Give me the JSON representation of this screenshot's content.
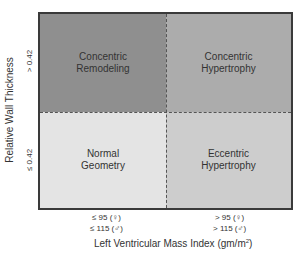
{
  "diagram": {
    "type": "2x2 classification grid",
    "y_axis": {
      "title": "Relative Wall Thickness",
      "ticks": [
        "> 0.42",
        "≤ 0.42"
      ]
    },
    "x_axis": {
      "title": "Left Ventricular Mass Index (gm/m",
      "title_sup": "2",
      "title_close": ")",
      "ticks": [
        {
          "line1": "≤ 95 (♀)",
          "line2": "≤ 115 (♂)"
        },
        {
          "line1": "> 95 (♀)",
          "line2": "> 115 (♂)"
        }
      ]
    },
    "quadrants": {
      "top_left": {
        "line1": "Concentric",
        "line2": "Remodeling",
        "color": "#8f8f8f"
      },
      "top_right": {
        "line1": "Concentric",
        "line2": "Hypertrophy",
        "color": "#acacac"
      },
      "bottom_left": {
        "line1": "Normal",
        "line2": "Geometry",
        "color": "#e4e4e4"
      },
      "bottom_right": {
        "line1": "Eccentric",
        "line2": "Hypertrophy",
        "color": "#cdcdcd"
      }
    }
  }
}
